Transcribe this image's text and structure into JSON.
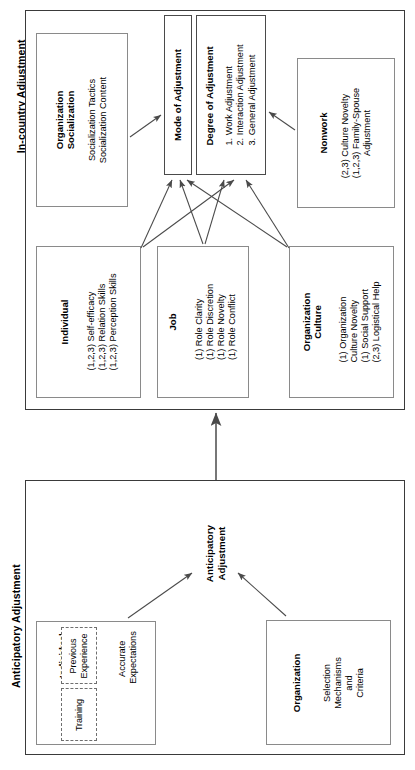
{
  "diagram": {
    "orientation": "rotated-90",
    "sections": [
      {
        "id": "in-country",
        "header": "In-country Adjustment",
        "boxes": [
          {
            "id": "organization-socialization",
            "title": "Organization\nSocialization",
            "title_lines": [
              "Organization",
              "Socialization"
            ],
            "lines": [
              "Socialization Tactics",
              "Socialization Content"
            ]
          },
          {
            "id": "mode-of-adjustment",
            "title_lines": [
              "Mode of Adjustment"
            ],
            "lines": []
          },
          {
            "id": "degree-of-adjustment",
            "title_lines": [
              "Degree of Adjustment"
            ],
            "lines": [
              "1.  Work Adjustment",
              "2.  Interaction Adjustment",
              "3.  General Adjustment"
            ]
          },
          {
            "id": "nonwork",
            "title_lines": [
              "Nonwork"
            ],
            "lines": [
              "(2,3) Culture Novelty",
              "(1,2,3) Family-Spouse",
              "Adjustment"
            ]
          },
          {
            "id": "individual-incountry",
            "title_lines": [
              "Individual"
            ],
            "lines": [
              "(1,2,3) Self-efficacy",
              "(1,2,3) Relation Skills",
              "(1,2,3) Perception Skills"
            ]
          },
          {
            "id": "job",
            "title_lines": [
              "Job"
            ],
            "lines": [
              "(1) Role Clarity",
              "(1) Role Discretion",
              "(1) Role Novelty",
              "(1) Role Conflict"
            ]
          },
          {
            "id": "organization-culture",
            "title_lines": [
              "Organization",
              "Culture"
            ],
            "lines": [
              "(1) Organization",
              "Culture Novelty",
              "(1) Social Support",
              "(2,3) Logistical Help"
            ]
          }
        ]
      },
      {
        "id": "anticipatory",
        "header": "Anticipatory Adjustment",
        "node_label_lines": [
          "Anticipatory",
          "Adjustment"
        ],
        "boxes": [
          {
            "id": "individual-anticipatory",
            "title_lines": [
              "Individual"
            ],
            "subboxes": [
              {
                "id": "previous-experience",
                "lines": [
                  "Previous",
                  "Experience"
                ]
              },
              {
                "id": "training",
                "lines": [
                  "Training"
                ]
              }
            ],
            "outcome_lines": [
              "Accurate",
              "Expectations"
            ]
          },
          {
            "id": "organization-anticipatory",
            "title_lines": [
              "Organization"
            ],
            "lines": [
              "Selection",
              "Mechanisms",
              "and",
              "Criteria"
            ]
          }
        ]
      }
    ],
    "colors": {
      "frame_border": "#3a3a3a",
      "box_border": "#8a8a8a",
      "dashed_border": "#6f6f6f",
      "arrow": "#4a4a4a",
      "text": "#000000",
      "background": "#ffffff"
    }
  }
}
